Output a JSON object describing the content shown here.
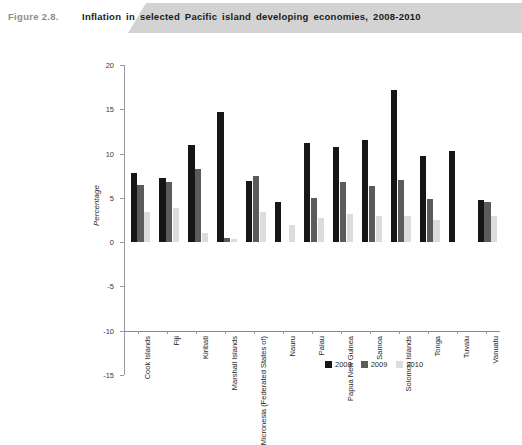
{
  "header": {
    "figure_number": "Figure 2.8.",
    "title": "Inflation in selected Pacific island developing economies, 2008-2010"
  },
  "chart_data": {
    "type": "bar",
    "title": "Inflation in selected Pacific island developing economies, 2008-2010",
    "xlabel": "",
    "ylabel": "Percentage",
    "ylim": [
      -15,
      20
    ],
    "ytick_values": [
      20,
      15,
      10,
      5,
      0,
      -5,
      -10,
      -15
    ],
    "ytick_labels": [
      "20",
      "15",
      "10",
      "5",
      "0",
      "-5",
      "-10",
      "-15"
    ],
    "grid": false,
    "legend_position": "bottom-right",
    "categories": [
      "Cook Islands",
      "Fiji",
      "Kiribati",
      "Marshall Islands",
      "Micronesia (Federated States of)",
      "Nauru",
      "Palau",
      "Papua New Guinea",
      "Samoa",
      "Solomon Islands",
      "Tonga",
      "Tuvalu",
      "Vanuatu"
    ],
    "series": [
      {
        "name": "2008",
        "color": "#161616",
        "values": [
          7.8,
          7.3,
          11.0,
          14.7,
          6.9,
          4.5,
          11.2,
          10.8,
          11.5,
          17.2,
          9.7,
          10.3,
          4.8
        ]
      },
      {
        "name": "2009",
        "color": "#5b5b5b",
        "values": [
          6.5,
          6.8,
          8.3,
          0.5,
          7.5,
          null,
          5.0,
          6.8,
          6.3,
          7.0,
          4.9,
          null,
          4.5
        ]
      },
      {
        "name": "2010",
        "color": "#dcdcdc",
        "values": [
          3.4,
          3.9,
          1.0,
          0.4,
          3.4,
          1.9,
          2.7,
          3.2,
          3.0,
          3.0,
          2.5,
          null,
          3.0
        ]
      }
    ]
  },
  "legend": {
    "items": [
      {
        "label": "2008",
        "color": "#161616"
      },
      {
        "label": "2009",
        "color": "#5b5b5b"
      },
      {
        "label": "2010",
        "color": "#dcdcdc"
      }
    ]
  }
}
